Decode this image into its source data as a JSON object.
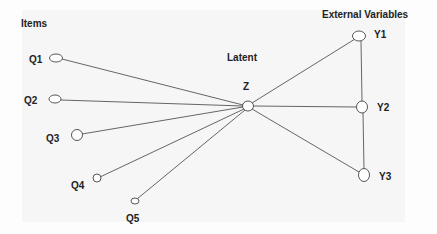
{
  "diagram": {
    "headings": {
      "items": "Items",
      "latent": "Latent",
      "external": "External Variables"
    },
    "latent_node": {
      "id": "Z",
      "label": "Z"
    },
    "items": [
      {
        "id": "Q1",
        "label": "Q1"
      },
      {
        "id": "Q2",
        "label": "Q2"
      },
      {
        "id": "Q3",
        "label": "Q3"
      },
      {
        "id": "Q4",
        "label": "Q4"
      },
      {
        "id": "Q5",
        "label": "Q5"
      }
    ],
    "external_variables": [
      {
        "id": "Y1",
        "label": "Y1"
      },
      {
        "id": "Y2",
        "label": "Y2"
      },
      {
        "id": "Y3",
        "label": "Y3"
      }
    ],
    "edges": [
      [
        "Q1",
        "Z"
      ],
      [
        "Q2",
        "Z"
      ],
      [
        "Q3",
        "Z"
      ],
      [
        "Q4",
        "Z"
      ],
      [
        "Q5",
        "Z"
      ],
      [
        "Z",
        "Y1"
      ],
      [
        "Z",
        "Y2"
      ],
      [
        "Z",
        "Y3"
      ],
      [
        "Y1",
        "Y2"
      ],
      [
        "Y2",
        "Y3"
      ]
    ]
  }
}
